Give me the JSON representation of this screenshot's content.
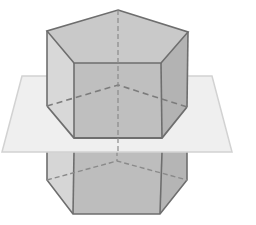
{
  "diagram": {
    "colors": {
      "background": "#ffffff",
      "top_face": "#c9c9c9",
      "front_face": "#bdbdbd",
      "left_face": "#d8d8d8",
      "right_face": "#b3b3b3",
      "plane": "#efefef",
      "plane_edge": "#d2d2d2",
      "edge": "#6e6e6e",
      "hidden_edge": "#8a8a8a"
    },
    "prism": {
      "top_vertices": [
        [
          118,
          10
        ],
        [
          188,
          32
        ],
        [
          161,
          63
        ],
        [
          74,
          63
        ],
        [
          47,
          31
        ]
      ],
      "section_vertices": [
        [
          118,
          85
        ],
        [
          187,
          107
        ],
        [
          162,
          138
        ],
        [
          74,
          138
        ],
        [
          47,
          106
        ]
      ],
      "bottom_vertices": [
        [
          117,
          161
        ],
        [
          187,
          180
        ],
        [
          160,
          214
        ],
        [
          73,
          214
        ],
        [
          47,
          180
        ]
      ]
    },
    "plane": {
      "corners": [
        [
          22,
          76
        ],
        [
          212,
          76
        ],
        [
          232,
          152
        ],
        [
          2,
          152
        ]
      ]
    }
  }
}
